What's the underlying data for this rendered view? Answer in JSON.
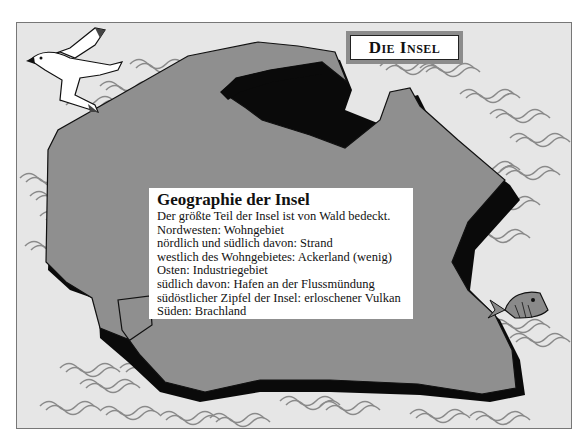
{
  "title": "Die Insel",
  "info": {
    "heading": "Geographie der Insel",
    "lines": [
      "Der größte Teil der Insel ist von Wald bedeckt.",
      "Nordwesten: Wohngebiet",
      "nördlich und südlich davon: Strand",
      "westlich des Wohngebietes: Ackerland (wenig)",
      "Osten: Industriegebiet",
      "südlich davon: Hafen an der Flussmündung",
      "südöstlicher Zipfel der Insel: erloschener Vulkan",
      "Süden: Brachland"
    ]
  },
  "illustration": {
    "island_color": "#8f8f8f",
    "shadow_color": "#0a0a0a",
    "sea_color": "#e6e6e6",
    "wave_color": "#8a8a8a",
    "icons": [
      "seagull-icon",
      "fish-icon",
      "wave-icon"
    ]
  }
}
